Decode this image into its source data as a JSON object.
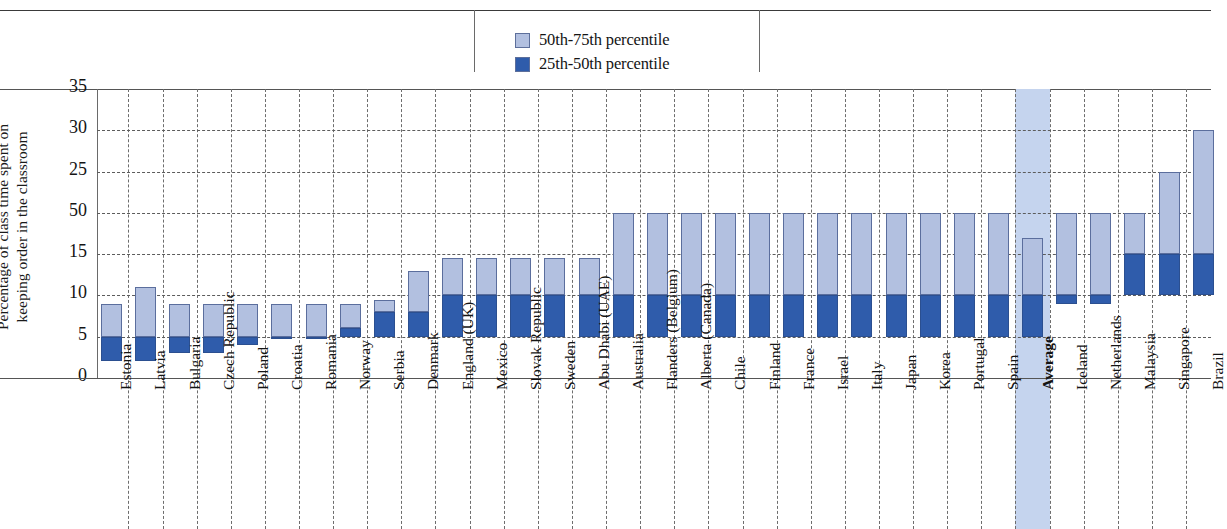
{
  "legend": {
    "items": [
      {
        "label": "50th-75th percentile",
        "color": "#b2c0e0"
      },
      {
        "label": "25th-50th percentile",
        "color": "#2f5cab"
      }
    ]
  },
  "axis": {
    "y_title": "Percentage of class time spent on\nkeeping order in the classroom",
    "y_ticks": [
      "35",
      "30",
      "25",
      "50",
      "15",
      "10",
      "5",
      "0"
    ]
  },
  "chart_data": {
    "type": "bar",
    "title": "",
    "subtitle": "",
    "xlabel": "",
    "ylabel": "Percentage of class time spent on keeping order in the classroom",
    "ylim": [
      0,
      35
    ],
    "ytick_values": [
      0,
      5,
      10,
      15,
      20,
      25,
      30,
      35
    ],
    "ytick_labels": [
      "0",
      "5",
      "10",
      "15",
      "50",
      "25",
      "30",
      "35"
    ],
    "grid": true,
    "legend_position": "top-center",
    "bar_style": "floating-range",
    "series": [
      {
        "name": "25th-50th percentile",
        "color": "#2f5cab"
      },
      {
        "name": "50th-75th percentile",
        "color": "#b2c0e0"
      }
    ],
    "categories": [
      "Estonia",
      "Latvia",
      "Bulgaria",
      "Czech Republic",
      "Poland",
      "Croatia",
      "Romania",
      "Norway",
      "Serbia",
      "Denmark",
      "England (UK)",
      "Mexico",
      "Slovak Republic",
      "Sweden",
      "Abu Dhabi (UAE)",
      "Australia",
      "Flanders (Belgium)",
      "Alberta (Canada)",
      "Chile",
      "Finland",
      "France",
      "Israel",
      "Italy",
      "Japan",
      "Korea",
      "Portugal",
      "Spain",
      "Average",
      "Iceland",
      "Netherlands",
      "Malaysia",
      "Singapore",
      "Brazil"
    ],
    "highlighted_category": "Average",
    "points": [
      {
        "category": "Estonia",
        "p25": 2,
        "p50": 5,
        "p75": 9
      },
      {
        "category": "Latvia",
        "p25": 2,
        "p50": 5,
        "p75": 11
      },
      {
        "category": "Bulgaria",
        "p25": 3,
        "p50": 5,
        "p75": 9
      },
      {
        "category": "Czech Republic",
        "p25": 3,
        "p50": 5,
        "p75": 9
      },
      {
        "category": "Poland",
        "p25": 4,
        "p50": 5,
        "p75": 9
      },
      {
        "category": "Croatia",
        "p25": 5,
        "p50": 5,
        "p75": 9
      },
      {
        "category": "Romania",
        "p25": 5,
        "p50": 5,
        "p75": 9
      },
      {
        "category": "Norway",
        "p25": 5,
        "p50": 6,
        "p75": 9
      },
      {
        "category": "Serbia",
        "p25": 5,
        "p50": 8,
        "p75": 9.5
      },
      {
        "category": "Denmark",
        "p25": 5,
        "p50": 8,
        "p75": 13
      },
      {
        "category": "England (UK)",
        "p25": 5,
        "p50": 10,
        "p75": 14.5
      },
      {
        "category": "Mexico",
        "p25": 5,
        "p50": 10,
        "p75": 14.5
      },
      {
        "category": "Slovak Republic",
        "p25": 5,
        "p50": 10,
        "p75": 14.5
      },
      {
        "category": "Sweden",
        "p25": 5,
        "p50": 10,
        "p75": 14.5
      },
      {
        "category": "Abu Dhabi (UAE)",
        "p25": 5,
        "p50": 10,
        "p75": 14.5
      },
      {
        "category": "Australia",
        "p25": 5,
        "p50": 10,
        "p75": 20
      },
      {
        "category": "Flanders (Belgium)",
        "p25": 5,
        "p50": 10,
        "p75": 20
      },
      {
        "category": "Alberta (Canada)",
        "p25": 5,
        "p50": 10,
        "p75": 20
      },
      {
        "category": "Chile",
        "p25": 5,
        "p50": 10,
        "p75": 20
      },
      {
        "category": "Finland",
        "p25": 5,
        "p50": 10,
        "p75": 20
      },
      {
        "category": "France",
        "p25": 5,
        "p50": 10,
        "p75": 20
      },
      {
        "category": "Israel",
        "p25": 5,
        "p50": 10,
        "p75": 20
      },
      {
        "category": "Italy",
        "p25": 5,
        "p50": 10,
        "p75": 20
      },
      {
        "category": "Japan",
        "p25": 5,
        "p50": 10,
        "p75": 20
      },
      {
        "category": "Korea",
        "p25": 5,
        "p50": 10,
        "p75": 20
      },
      {
        "category": "Portugal",
        "p25": 5,
        "p50": 10,
        "p75": 20
      },
      {
        "category": "Spain",
        "p25": 5,
        "p50": 10,
        "p75": 20
      },
      {
        "category": "Average",
        "p25": 5,
        "p50": 10,
        "p75": 17
      },
      {
        "category": "Iceland",
        "p25": 9,
        "p50": 10,
        "p75": 20
      },
      {
        "category": "Netherlands",
        "p25": 9,
        "p50": 10,
        "p75": 20
      },
      {
        "category": "Malaysia",
        "p25": 10,
        "p50": 15,
        "p75": 20
      },
      {
        "category": "Singapore",
        "p25": 10,
        "p50": 15,
        "p75": 25
      },
      {
        "category": "Brazil",
        "p25": 10,
        "p50": 15,
        "p75": 30
      }
    ]
  }
}
